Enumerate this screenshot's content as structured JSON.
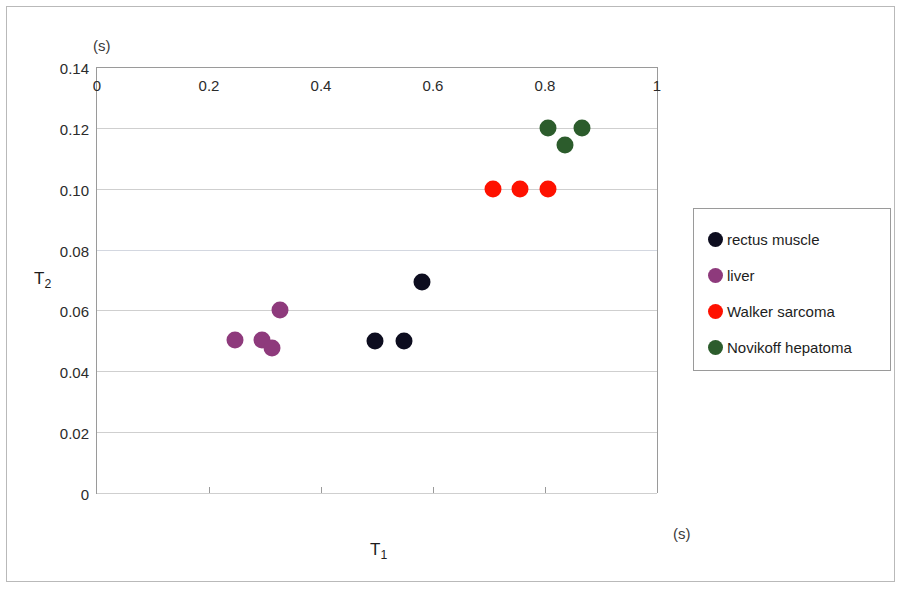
{
  "chart_data": {
    "type": "scatter",
    "title": "",
    "xlabel": "T1",
    "ylabel": "T2",
    "x_unit": "(s)",
    "y_unit": "(s)",
    "xlim": [
      0,
      1
    ],
    "ylim": [
      0,
      0.14
    ],
    "xticks": [
      "0",
      "0.2",
      "0.4",
      "0.6",
      "0.8",
      "1"
    ],
    "xtick_values": [
      0,
      0.2,
      0.4,
      0.6,
      0.8,
      1
    ],
    "yticks": [
      "0",
      "0.02",
      "0.04",
      "0.06",
      "0.08",
      "0.10",
      "0.12",
      "0.14"
    ],
    "ytick_values": [
      0,
      0.02,
      0.04,
      0.06,
      0.08,
      0.1,
      0.12,
      0.14
    ],
    "grid": "horizontal",
    "legend_position": "right",
    "series": [
      {
        "name": "rectus muscle",
        "color": "#0d0d1f",
        "points": [
          {
            "x": 0.496,
            "y": 0.05
          },
          {
            "x": 0.548,
            "y": 0.05
          },
          {
            "x": 0.58,
            "y": 0.0695
          }
        ]
      },
      {
        "name": "liver",
        "color": "#8e3a7c",
        "points": [
          {
            "x": 0.246,
            "y": 0.0502
          },
          {
            "x": 0.295,
            "y": 0.0502
          },
          {
            "x": 0.313,
            "y": 0.0478
          },
          {
            "x": 0.327,
            "y": 0.06
          }
        ]
      },
      {
        "name": "Walker sarcoma",
        "color": "#fe1100",
        "points": [
          {
            "x": 0.707,
            "y": 0.1
          },
          {
            "x": 0.755,
            "y": 0.1
          },
          {
            "x": 0.805,
            "y": 0.1
          }
        ]
      },
      {
        "name": "Novikoff hepatoma",
        "color": "#2c5c2c",
        "points": [
          {
            "x": 0.805,
            "y": 0.12
          },
          {
            "x": 0.866,
            "y": 0.12
          },
          {
            "x": 0.836,
            "y": 0.1145
          }
        ]
      }
    ]
  },
  "legend": {
    "items": [
      {
        "label": "rectus muscle",
        "color": "#0d0d1f"
      },
      {
        "label": "liver",
        "color": "#8e3a7c"
      },
      {
        "label": "Walker sarcoma",
        "color": "#fe1100"
      },
      {
        "label": "Novikoff hepatoma",
        "color": "#2c5c2c"
      }
    ]
  }
}
